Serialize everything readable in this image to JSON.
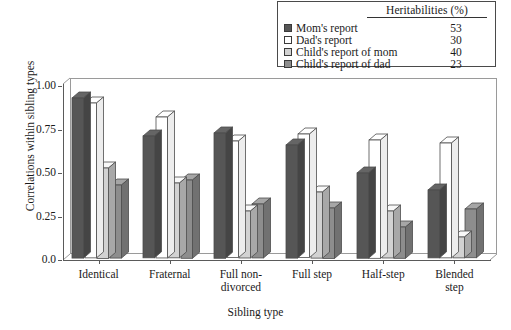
{
  "legend": {
    "header": "Heritabilities (%)",
    "items": [
      {
        "label": "Mom's report",
        "value": "53",
        "color": "#565656",
        "swatch_name": "legend-swatch-moms-report"
      },
      {
        "label": "Dad's report",
        "value": "30",
        "color": "#ffffff",
        "swatch_name": "legend-swatch-dads-report"
      },
      {
        "label": "Child's report of mom",
        "value": "40",
        "color": "#d2d2d2",
        "swatch_name": "legend-swatch-childs-report-of-mom"
      },
      {
        "label": "Child's report of dad",
        "value": "23",
        "color": "#8d8d8d",
        "swatch_name": "legend-swatch-childs-report-of-dad"
      }
    ]
  },
  "chart_data": {
    "type": "bar",
    "title": "",
    "xlabel": "Sibling type",
    "ylabel": "Correlations within sibling types",
    "categories": [
      "Identical",
      "Fraternal",
      "Full non-\ndivorced",
      "Full step",
      "Half-step",
      "Blended\nstep"
    ],
    "series": [
      {
        "name": "Mom's report",
        "color": "#565656",
        "values": [
          0.92,
          0.7,
          0.72,
          0.65,
          0.49,
          0.39
        ]
      },
      {
        "name": "Dad's report",
        "color": "#ffffff",
        "values": [
          0.89,
          0.81,
          0.67,
          0.71,
          0.68,
          0.66
        ]
      },
      {
        "name": "Child's report of mom",
        "color": "#d2d2d2",
        "values": [
          0.52,
          0.43,
          0.27,
          0.38,
          0.27,
          0.12
        ]
      },
      {
        "name": "Child's report of dad",
        "color": "#8d8d8d",
        "values": [
          0.42,
          0.45,
          0.31,
          0.29,
          0.18,
          0.28
        ]
      }
    ],
    "ylim": [
      0.0,
      1.0
    ],
    "yticks": [
      "0.0",
      "0.25",
      "0.50",
      "0.75",
      "1.00"
    ],
    "ytick_values": [
      0.0,
      0.25,
      0.5,
      0.75,
      1.0
    ],
    "grid": false,
    "legend_position": "top-right"
  }
}
